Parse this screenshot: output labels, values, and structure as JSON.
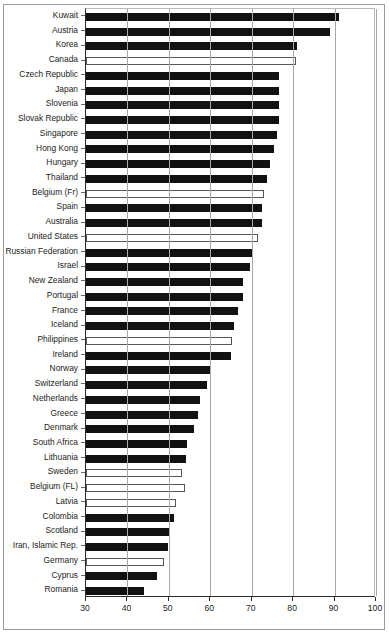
{
  "chart_data": {
    "type": "bar",
    "orientation": "horizontal",
    "title": "",
    "xlabel": "",
    "ylabel": "",
    "xlim": [
      30,
      100
    ],
    "xticks": [
      30,
      40,
      50,
      60,
      70,
      80,
      90,
      100
    ],
    "grid": true,
    "legend": "none",
    "series_note": "Bars are drawn either solid black (filled) or white with black outline (hollow)",
    "categories": [
      "Kuwait",
      "Austria",
      "Korea",
      "Canada",
      "Czech Republic",
      "Japan",
      "Slovenia",
      "Slovak Republic",
      "Singapore",
      "Hong Kong",
      "Hungary",
      "Thailand",
      "Belgium (Fr)",
      "Spain",
      "Australia",
      "United States",
      "Russian Federation",
      "Israel",
      "New Zealand",
      "Portugal",
      "France",
      "Iceland",
      "Philippines",
      "Ireland",
      "Norway",
      "Switzerland",
      "Netherlands",
      "Greece",
      "Denmark",
      "South Africa",
      "Lithuania",
      "Sweden",
      "Belgium (FL)",
      "Latvia",
      "Colombia",
      "Scotland",
      "Iran, Islamic Rep.",
      "Germany",
      "Cyprus",
      "Romania"
    ],
    "values": [
      91.0,
      89.0,
      81.0,
      80.6,
      76.7,
      76.7,
      76.7,
      76.7,
      76.0,
      75.4,
      74.5,
      73.8,
      73.0,
      72.4,
      72.4,
      71.4,
      70.2,
      69.5,
      67.8,
      67.8,
      66.8,
      65.8,
      65.3,
      64.9,
      60.0,
      59.3,
      57.4,
      57.1,
      56.1,
      54.4,
      54.2,
      53.2,
      53.8,
      51.8,
      51.3,
      50.3,
      49.9,
      48.9,
      47.2,
      44.0
    ],
    "fills": [
      "filled",
      "filled",
      "filled",
      "hollow",
      "filled",
      "filled",
      "filled",
      "filled",
      "filled",
      "filled",
      "filled",
      "filled",
      "hollow",
      "filled",
      "filled",
      "hollow",
      "filled",
      "filled",
      "filled",
      "filled",
      "filled",
      "filled",
      "hollow",
      "filled",
      "filled",
      "filled",
      "filled",
      "filled",
      "filled",
      "filled",
      "filled",
      "hollow",
      "hollow",
      "hollow",
      "filled",
      "filled",
      "filled",
      "hollow",
      "filled",
      "filled"
    ],
    "colors": {
      "filled": "#111111",
      "hollow_fill": "#ffffff",
      "hollow_stroke": "#555555",
      "axis": "#2b2b2b",
      "grid": "#a8a8a8",
      "text": "#1c1c1c",
      "frame": "#9a9a9a"
    }
  }
}
